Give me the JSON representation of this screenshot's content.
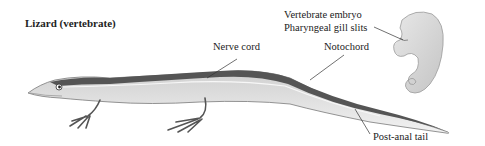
{
  "title": "Lizard (vertebrate)",
  "labels": {
    "nerve_cord": "Nerve cord",
    "notochord": "Notochord",
    "embryo_title": "Vertebrate embryo",
    "gill_slits": "Pharyngeal gill slits",
    "post_anal_tail": "Post-anal tail"
  },
  "colors": {
    "body_light": "#e6e6e6",
    "body_mid": "#bdbdbd",
    "dorsal_dark": "#4a4a4a",
    "leader_line": "#333333"
  }
}
